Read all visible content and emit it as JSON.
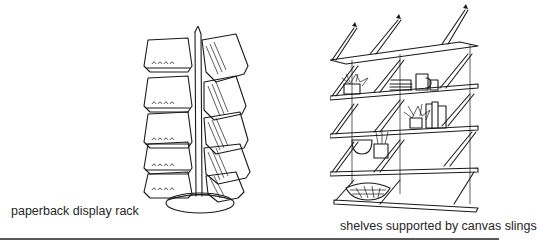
{
  "figures": [
    {
      "id": "rack",
      "illustration": "paperback-display-rack-drawing",
      "caption": "paperback display rack"
    },
    {
      "id": "shelves",
      "illustration": "canvas-sling-shelves-drawing",
      "caption": "shelves supported by canvas slings"
    }
  ],
  "colors": {
    "ink": "#1a1a1a",
    "background": "#ffffff",
    "rule": "#5a5a5a"
  }
}
